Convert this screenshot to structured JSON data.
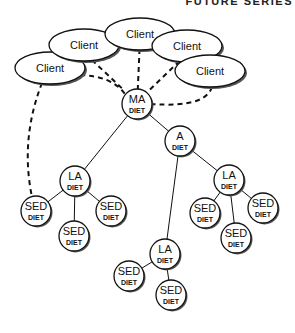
{
  "header": {
    "text": "FUTURE SERIES"
  },
  "diagram": {
    "clients": [
      {
        "id": "c1",
        "label": "Client",
        "cx": 50,
        "cy": 68,
        "rx": 35,
        "ry": 16
      },
      {
        "id": "c2",
        "label": "Client",
        "cx": 84,
        "cy": 45,
        "rx": 35,
        "ry": 16
      },
      {
        "id": "c3",
        "label": "Client",
        "cx": 140,
        "cy": 34,
        "rx": 35,
        "ry": 16
      },
      {
        "id": "c4",
        "label": "Client",
        "cx": 187,
        "cy": 46,
        "rx": 35,
        "ry": 16
      },
      {
        "id": "c5",
        "label": "Client",
        "cx": 210,
        "cy": 71,
        "rx": 35,
        "ry": 16
      }
    ],
    "nodes": [
      {
        "id": "ma",
        "top": "MA",
        "sub": "DIET",
        "cx": 137,
        "cy": 104
      },
      {
        "id": "a",
        "top": "A",
        "sub": "DIET",
        "cx": 180,
        "cy": 141
      },
      {
        "id": "la1",
        "top": "LA",
        "sub": "DIET",
        "cx": 75,
        "cy": 181
      },
      {
        "id": "la2",
        "top": "LA",
        "sub": "DIET",
        "cx": 229,
        "cy": 180
      },
      {
        "id": "la3",
        "top": "LA",
        "sub": "DIET",
        "cx": 165,
        "cy": 254
      },
      {
        "id": "sed1",
        "top": "SED",
        "sub": "DIET",
        "cx": 36,
        "cy": 211
      },
      {
        "id": "sed2",
        "top": "SED",
        "sub": "DIET",
        "cx": 111,
        "cy": 211
      },
      {
        "id": "sed3",
        "top": "SED",
        "sub": "DIET",
        "cx": 74,
        "cy": 236
      },
      {
        "id": "sed4",
        "top": "SED",
        "sub": "DIET",
        "cx": 205,
        "cy": 213
      },
      {
        "id": "sed5",
        "top": "SED",
        "sub": "DIET",
        "cx": 263,
        "cy": 208
      },
      {
        "id": "sed6",
        "top": "SED",
        "sub": "DIET",
        "cx": 236,
        "cy": 238
      },
      {
        "id": "sed7",
        "top": "SED",
        "sub": "DIET",
        "cx": 129,
        "cy": 276
      },
      {
        "id": "sed8",
        "top": "SED",
        "sub": "DIET",
        "cx": 171,
        "cy": 295
      }
    ],
    "tree_edges": [
      [
        "ma",
        "la1"
      ],
      [
        "ma",
        "a"
      ],
      [
        "a",
        "la2"
      ],
      [
        "a",
        "la3"
      ],
      [
        "la1",
        "sed1"
      ],
      [
        "la1",
        "sed2"
      ],
      [
        "la1",
        "sed3"
      ],
      [
        "la2",
        "sed4"
      ],
      [
        "la2",
        "sed5"
      ],
      [
        "la2",
        "sed6"
      ],
      [
        "la3",
        "sed7"
      ],
      [
        "la3",
        "sed8"
      ]
    ],
    "dashed_links": [
      {
        "from": "c1",
        "to": "ma"
      },
      {
        "from": "c2",
        "to": "ma"
      },
      {
        "from": "c3",
        "to": "ma"
      },
      {
        "from": "c4",
        "to": "ma"
      },
      {
        "from": "c5",
        "to": "ma"
      },
      {
        "from": "c1",
        "to": "sed1"
      }
    ],
    "node_radius": 15,
    "stroke_color": "#111111",
    "fill_color": "#ffffff",
    "shadow_color": "#555555"
  }
}
